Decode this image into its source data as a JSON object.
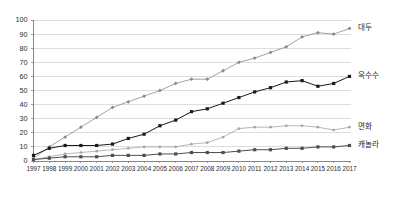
{
  "chart_data": {
    "type": "line",
    "title": "",
    "subtitle": "",
    "xlabel": "",
    "ylabel": "",
    "ylim": [
      0,
      100
    ],
    "ytick_step": 10,
    "grid": true,
    "grid_axis": "y",
    "legend_position": "right-inline-labels",
    "categories": [
      "1997",
      "1998",
      "1999",
      "2000",
      "2001",
      "2002",
      "2003",
      "2004",
      "2005",
      "2006",
      "2007",
      "2008",
      "2009",
      "2010",
      "2011",
      "2012",
      "2013",
      "2014",
      "2015",
      "2016",
      "2017"
    ],
    "yticks": [
      0,
      10,
      20,
      30,
      40,
      50,
      60,
      70,
      80,
      90,
      100
    ],
    "series": [
      {
        "name": "대두",
        "label": "대두",
        "color": "#8a8a8a",
        "marker": "diamond",
        "values": [
          2,
          10,
          17,
          24,
          31,
          38,
          42,
          46,
          50,
          55,
          58,
          58,
          64,
          70,
          73,
          77,
          81,
          88,
          91,
          90,
          94
        ]
      },
      {
        "name": "옥수수",
        "label": "옥수수",
        "color": "#1a1a1a",
        "marker": "square",
        "values": [
          4,
          9,
          11,
          11,
          11,
          12,
          16,
          19,
          25,
          29,
          35,
          37,
          41,
          45,
          49,
          52,
          56,
          57,
          53,
          55,
          60
        ]
      },
      {
        "name": "면화",
        "label": "면화",
        "color": "#a5a5a5",
        "marker": "dot",
        "values": [
          1,
          3,
          5,
          6,
          7,
          8,
          9,
          10,
          10,
          10,
          12,
          13,
          17,
          23,
          24,
          24,
          25,
          25,
          24,
          22,
          24
        ]
      },
      {
        "name": "캐놀라",
        "label": "캐놀라",
        "color": "#4d4d4d",
        "marker": "square",
        "values": [
          1,
          2,
          3,
          3,
          3,
          4,
          4,
          4,
          5,
          5,
          6,
          6,
          6,
          7,
          8,
          8,
          9,
          9,
          10,
          10,
          11
        ]
      }
    ]
  },
  "axis_colors": {
    "axis_line": "#7a7a7a",
    "grid_line": "#cfcfcf",
    "tick_text": "#2b2b2b"
  }
}
